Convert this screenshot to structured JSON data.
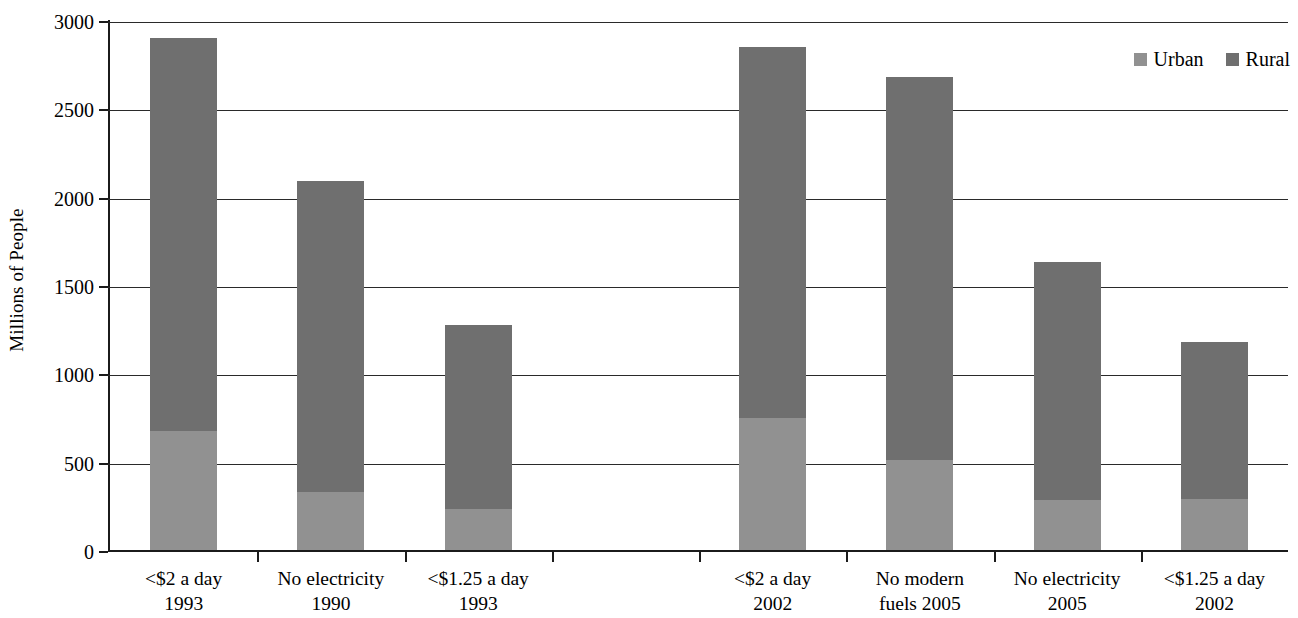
{
  "chart_data": {
    "type": "bar",
    "subtype": "stacked-bar",
    "title": "",
    "xlabel": "",
    "ylabel": "Millions of People",
    "ylim": [
      0,
      3000
    ],
    "ytick_values": [
      0,
      500,
      1000,
      1500,
      2000,
      2500,
      3000
    ],
    "ytick_labels": [
      "0",
      "500",
      "1000",
      "1500",
      "2000",
      "2500",
      "3000"
    ],
    "grid": true,
    "grid_axis": "y",
    "legend_position": "top-right",
    "categories": [
      "<$2 a day 1993",
      "No electricity 1990",
      "<$1.25 a day 1993",
      "<$2 a day 2002",
      "No modern fuels 2005",
      "No electricity 2005",
      "<$1.25 a day 2002"
    ],
    "category_lines": [
      [
        "<$2 a day",
        "1993"
      ],
      [
        "No electricity",
        "1990"
      ],
      [
        "<$1.25 a day",
        "1993"
      ],
      [
        "<$2 a day",
        "2002"
      ],
      [
        "No modern",
        "fuels 2005"
      ],
      [
        "No electricity",
        "2005"
      ],
      [
        "<$1.25 a day",
        "2002"
      ]
    ],
    "series": [
      {
        "name": "Urban",
        "color": "#919191",
        "values": [
          675,
          330,
          230,
          750,
          510,
          285,
          290
        ]
      },
      {
        "name": "Rural",
        "color": "#6f6f6f",
        "values": [
          2225,
          1760,
          1045,
          2100,
          2170,
          1345,
          890
        ]
      }
    ],
    "totals": [
      2900,
      2090,
      1275,
      2850,
      2680,
      1630,
      1180
    ]
  },
  "legend": {
    "entries": [
      {
        "label": "Urban",
        "color": "#919191"
      },
      {
        "label": "Rural",
        "color": "#6f6f6f"
      }
    ]
  },
  "axes": {
    "y_title": "Millions of People"
  }
}
